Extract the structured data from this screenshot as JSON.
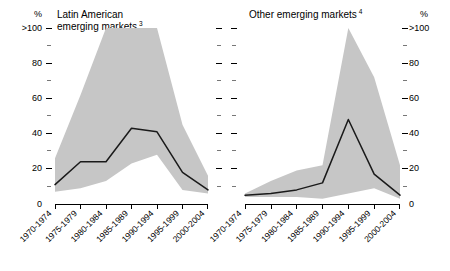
{
  "chart_data": [
    {
      "type": "line",
      "title": "Latin American emerging markets",
      "title_footnote": "3",
      "panel": "left",
      "xlabel": "",
      "ylabel": "%",
      "ylim": [
        0,
        100
      ],
      "ytick_labels": [
        "0",
        "20",
        "40",
        "60",
        "80",
        ">100"
      ],
      "ytick_values": [
        0,
        20,
        40,
        60,
        80,
        100
      ],
      "yminor_values": [
        10,
        30,
        50,
        70,
        90
      ],
      "grid": false,
      "legend": "none",
      "categories": [
        "1970-1974",
        "1975-1979",
        "1980-1984",
        "1985-1989",
        "1990-1994",
        "1995-1999",
        "2000-2004"
      ],
      "series": [
        {
          "name": "median",
          "values": [
            11,
            24,
            24,
            43,
            41,
            18,
            8
          ]
        }
      ],
      "band": {
        "name": "range",
        "upper": [
          26,
          62,
          100,
          100,
          100,
          45,
          16
        ],
        "lower": [
          7,
          9,
          13,
          23,
          28,
          8,
          6
        ],
        "upper_clipped_at": 100,
        "color": "#c6c6c6"
      }
    },
    {
      "type": "line",
      "title": "Other emerging markets",
      "title_footnote": "4",
      "panel": "right",
      "xlabel": "",
      "ylabel": "%",
      "ylim": [
        0,
        100
      ],
      "ytick_labels": [
        "0",
        "20",
        "40",
        "60",
        "80",
        ">100"
      ],
      "ytick_values": [
        0,
        20,
        40,
        60,
        80,
        100
      ],
      "yminor_values": [
        10,
        30,
        50,
        70,
        90
      ],
      "grid": false,
      "legend": "none",
      "categories": [
        "1970-1974",
        "1975-1979",
        "1980-1984",
        "1985-1989",
        "1990-1994",
        "1995-1999",
        "2000-2004"
      ],
      "series": [
        {
          "name": "median",
          "values": [
            5,
            6,
            8,
            12,
            48,
            17,
            5
          ]
        }
      ],
      "band": {
        "name": "range",
        "upper": [
          6,
          13,
          19,
          22,
          100,
          72,
          22
        ],
        "lower": [
          4,
          4,
          4,
          3,
          6,
          9,
          3
        ],
        "upper_clipped_at": 100,
        "color": "#c6c6c6"
      }
    }
  ],
  "axes": {
    "left_unit": "%",
    "right_unit": "%",
    "left_ticks": [
      ">100",
      "80",
      "60",
      "40",
      "20",
      "0"
    ],
    "right_ticks": [
      ">100",
      "80",
      "60",
      "40",
      "20",
      "0"
    ]
  }
}
